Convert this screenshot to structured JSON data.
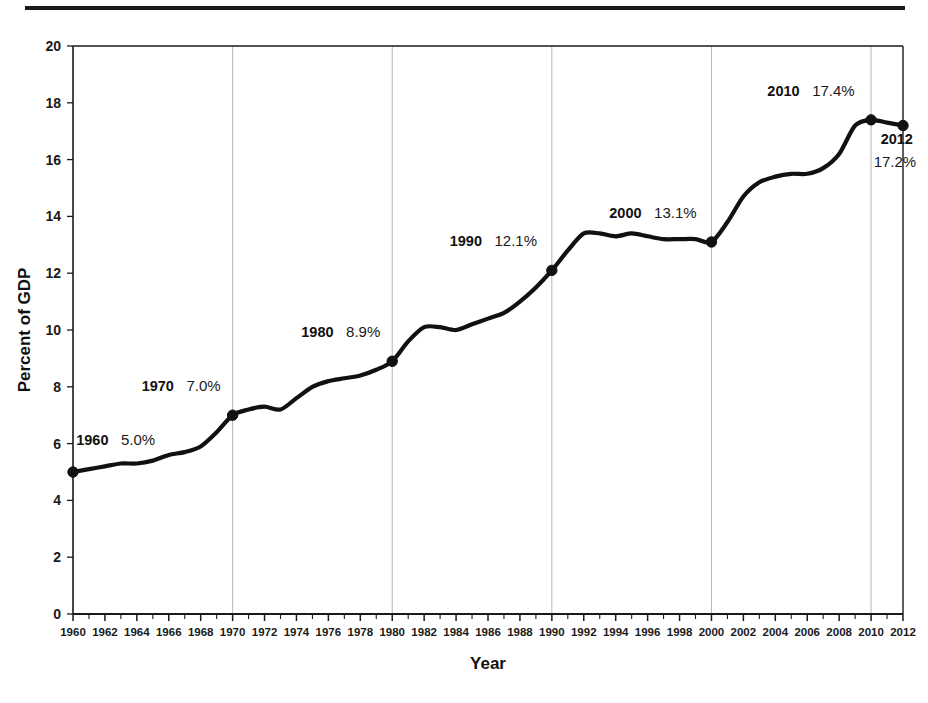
{
  "figure": {
    "background_color": "#ffffff",
    "rule_color": "#1a1a1a"
  },
  "chart_data": {
    "type": "line",
    "title": "",
    "subtitle": "",
    "xlabel": "Year",
    "ylabel": "Percent of GDP",
    "xlim": [
      1960,
      2012
    ],
    "ylim": [
      0,
      20
    ],
    "grid": "vertical-decades",
    "legend": "none",
    "line_color": "#111111",
    "marker_color": "#111111",
    "gridline_color": "#b6b6b6",
    "axis_color": "#1a1a1a",
    "ytick_labels": [
      "0",
      "2",
      "4",
      "6",
      "8",
      "10",
      "12",
      "14",
      "16",
      "18",
      "20"
    ],
    "ytick_values": [
      0,
      2,
      4,
      6,
      8,
      10,
      12,
      14,
      16,
      18,
      20
    ],
    "xtick_labels": [
      "1960",
      "1962",
      "1964",
      "1966",
      "1968",
      "1970",
      "1972",
      "1974",
      "1976",
      "1978",
      "1980",
      "1982",
      "1984",
      "1986",
      "1988",
      "1990",
      "1992",
      "1994",
      "1996",
      "1998",
      "2000",
      "2002",
      "2004",
      "2006",
      "2008",
      "2010",
      "2012"
    ],
    "xtick_values": [
      1960,
      1962,
      1964,
      1966,
      1968,
      1970,
      1972,
      1974,
      1976,
      1978,
      1980,
      1982,
      1984,
      1986,
      1988,
      1990,
      1992,
      1994,
      1996,
      1998,
      2000,
      2002,
      2004,
      2006,
      2008,
      2010,
      2012
    ],
    "gridline_years": [
      1970,
      1980,
      1990,
      2000,
      2010
    ],
    "x": [
      1960,
      1961,
      1962,
      1963,
      1964,
      1965,
      1966,
      1967,
      1968,
      1969,
      1970,
      1971,
      1972,
      1973,
      1974,
      1975,
      1976,
      1977,
      1978,
      1979,
      1980,
      1981,
      1982,
      1983,
      1984,
      1985,
      1986,
      1987,
      1988,
      1989,
      1990,
      1991,
      1992,
      1993,
      1994,
      1995,
      1996,
      1997,
      1998,
      1999,
      2000,
      2001,
      2002,
      2003,
      2004,
      2005,
      2006,
      2007,
      2008,
      2009,
      2010,
      2011,
      2012
    ],
    "y": [
      5.0,
      5.1,
      5.2,
      5.3,
      5.3,
      5.4,
      5.6,
      5.7,
      5.9,
      6.4,
      7.0,
      7.2,
      7.3,
      7.2,
      7.6,
      8.0,
      8.2,
      8.3,
      8.4,
      8.6,
      8.9,
      9.6,
      10.1,
      10.1,
      10.0,
      10.2,
      10.4,
      10.6,
      11.0,
      11.5,
      12.1,
      12.8,
      13.4,
      13.4,
      13.3,
      13.4,
      13.3,
      13.2,
      13.2,
      13.2,
      13.1,
      13.8,
      14.7,
      15.2,
      15.4,
      15.5,
      15.5,
      15.7,
      16.2,
      17.2,
      17.4,
      17.3,
      17.2
    ],
    "series_name": "Health care spending as percent of GDP",
    "annotations": [
      {
        "year_label": "1960",
        "value_label": "5.0%",
        "x": 1960,
        "y": 5.0,
        "label_x": 1960.2,
        "label_y": 5.95
      },
      {
        "year_label": "1970",
        "value_label": "7.0%",
        "x": 1970,
        "y": 7.0,
        "label_x": 1964.3,
        "label_y": 7.85
      },
      {
        "year_label": "1980",
        "value_label": "8.9%",
        "x": 1980,
        "y": 8.9,
        "label_x": 1974.3,
        "label_y": 9.75
      },
      {
        "year_label": "1990",
        "value_label": "12.1%",
        "x": 1990,
        "y": 12.1,
        "label_x": 1983.6,
        "label_y": 12.95
      },
      {
        "year_label": "2000",
        "value_label": "13.1%",
        "x": 2000,
        "y": 13.1,
        "label_x": 1993.6,
        "label_y": 13.95
      },
      {
        "year_label": "2010",
        "value_label": "17.4%",
        "x": 2010,
        "y": 17.4,
        "label_x": 2003.5,
        "label_y": 18.25
      },
      {
        "year_label": "2012",
        "value_label": "17.2%",
        "x": 2012,
        "y": 17.2,
        "label_x": 2010.6,
        "label_y": 16.55,
        "stacked": true
      }
    ],
    "markers": [
      {
        "x": 1960,
        "y": 5.0
      },
      {
        "x": 1970,
        "y": 7.0
      },
      {
        "x": 1980,
        "y": 8.9
      },
      {
        "x": 1990,
        "y": 12.1
      },
      {
        "x": 2000,
        "y": 13.1
      },
      {
        "x": 2010,
        "y": 17.4
      },
      {
        "x": 2012,
        "y": 17.2
      }
    ]
  }
}
